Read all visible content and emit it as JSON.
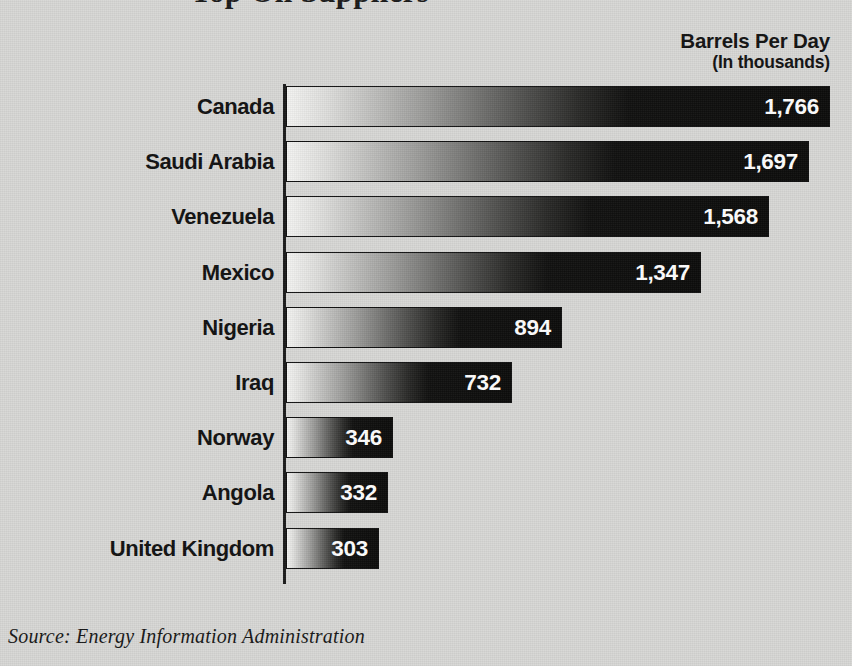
{
  "chart": {
    "title_clipped": "Top Oil Suppliers",
    "legend": {
      "title": "Barrels Per Day",
      "subtitle": "(In thousands)"
    },
    "source": "Source: Energy Information Administration"
  },
  "chart_data": {
    "type": "bar",
    "orientation": "horizontal",
    "title": "Top Oil Suppliers",
    "xlabel": "Barrels Per Day (In thousands)",
    "ylabel": "",
    "xlim": [
      0,
      1766
    ],
    "grid": false,
    "legend_position": "top-right",
    "value_unit": "thousands of barrels per day",
    "categories": [
      "Canada",
      "Saudi Arabia",
      "Venezuela",
      "Mexico",
      "Nigeria",
      "Iraq",
      "Norway",
      "Angola",
      "United Kingdom"
    ],
    "values": [
      1766,
      1697,
      1568,
      1347,
      894,
      732,
      346,
      332,
      303
    ],
    "value_labels": [
      "1,766",
      "1,697",
      "1,568",
      "1,347",
      "894",
      "732",
      "346",
      "332",
      "303"
    ],
    "annotations": [
      "Source: Energy Information Administration"
    ],
    "style": {
      "bar_fill": "horizontal gradient white-to-black",
      "background": "#d8d8d6",
      "bar_outline": "#111111",
      "value_label_color": "#ffffff"
    }
  }
}
